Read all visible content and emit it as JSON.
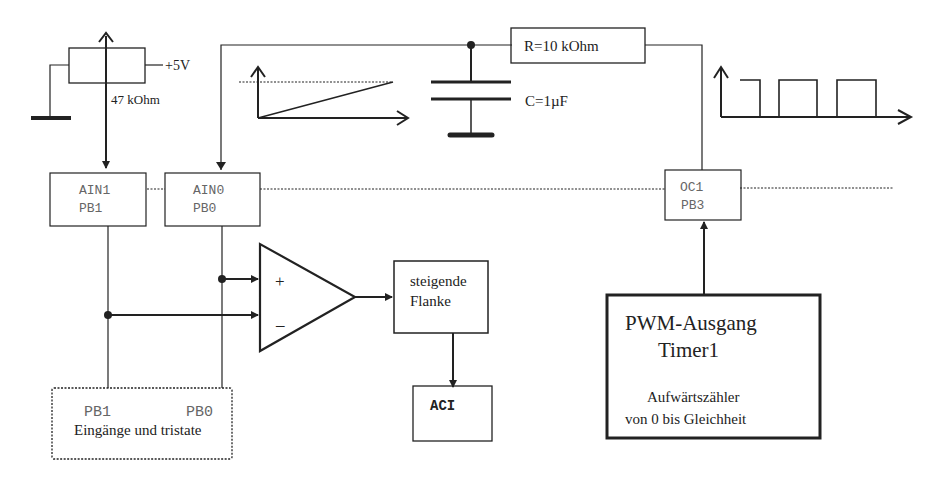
{
  "diagram": {
    "potentiometer": {
      "supply_label": "+5V",
      "value_label": "47 kOhm"
    },
    "resistor": {
      "label": "R=10 kOhm"
    },
    "capacitor": {
      "label": "C=1µF"
    },
    "pins": {
      "ain1": {
        "line1": "AIN1",
        "line2": "PB1"
      },
      "ain0": {
        "line1": "AIN0",
        "line2": "PB0"
      },
      "oc1": {
        "line1": "OC1",
        "line2": "PB3"
      }
    },
    "comparator": {
      "plus": "+",
      "minus": "–"
    },
    "edge_block": {
      "line1": "steigende",
      "line2": "Flanke"
    },
    "aci_block": {
      "label": "ACI"
    },
    "pwm_block": {
      "line1": "PWM-Ausgang",
      "line2": "Timer1",
      "line3": "Aufwärtszähler",
      "line4": "von 0 bis Gleichheit"
    },
    "io_block": {
      "pin_left": "PB1",
      "pin_right": "PB0",
      "caption": "Eingänge und tristate"
    }
  }
}
